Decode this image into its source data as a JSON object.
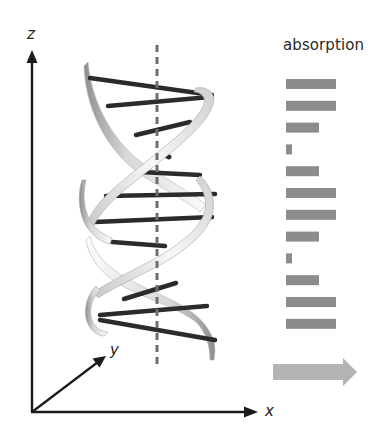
{
  "figure": {
    "title": "absorption",
    "axes": {
      "z_label": "z",
      "y_label": "y",
      "x_label": "x"
    },
    "colors": {
      "axis": "#1a1a1a",
      "base_pair": "#2b2b2b",
      "backbone_light": "#f2f2f2",
      "backbone_shadow": "#9a9a9a",
      "helix_axis_dash": "#6e6e6e",
      "absorption_bar": "#8c8c8c",
      "propagation_arrow": "#b3b3b3"
    },
    "helix": {
      "description": "DNA double helix with base pairs, vertical dashed helix axis",
      "base_pair_count": 12
    },
    "absorption_bars": [
      {
        "index": 1,
        "level": "high",
        "width": 50
      },
      {
        "index": 2,
        "level": "high",
        "width": 50
      },
      {
        "index": 3,
        "level": "medium",
        "width": 33
      },
      {
        "index": 4,
        "level": "low",
        "width": 6
      },
      {
        "index": 5,
        "level": "medium",
        "width": 33
      },
      {
        "index": 6,
        "level": "high",
        "width": 50
      },
      {
        "index": 7,
        "level": "high",
        "width": 50
      },
      {
        "index": 8,
        "level": "medium",
        "width": 33
      },
      {
        "index": 9,
        "level": "low",
        "width": 6
      },
      {
        "index": 10,
        "level": "medium",
        "width": 33
      },
      {
        "index": 11,
        "level": "high",
        "width": 50
      },
      {
        "index": 12,
        "level": "high",
        "width": 50
      }
    ],
    "propagation_arrow": {
      "direction": "right"
    }
  }
}
